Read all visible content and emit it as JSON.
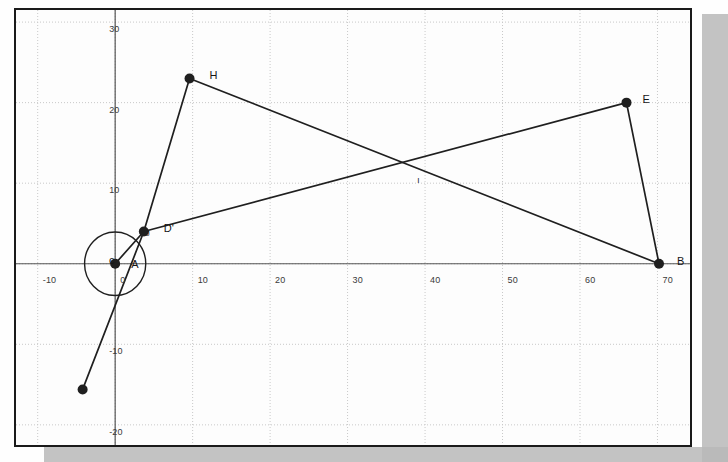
{
  "figure": {
    "title": "",
    "background_color": "#fdfdfd",
    "frame_color": "#1a1a1a",
    "grid_color": "#c9c9c9",
    "axis_color": "#555555",
    "stroke_color": "#1f1f1f"
  },
  "chart_data": {
    "type": "scatter",
    "title": "",
    "xlabel": "",
    "ylabel": "",
    "xlim": [
      -12.8,
      74.2
    ],
    "ylim": [
      -22.5,
      31.5
    ],
    "grid": true,
    "legend": null,
    "xticks": [
      -10,
      0,
      10,
      20,
      30,
      40,
      50,
      60,
      70
    ],
    "xtick_labels": [
      "-10",
      "0",
      "10",
      "20",
      "30",
      "40",
      "50",
      "60",
      "70"
    ],
    "yticks": [
      -20,
      -10,
      0,
      10,
      20,
      30
    ],
    "ytick_labels": [
      "-20",
      "-10",
      "0",
      "10",
      "20",
      "30"
    ],
    "points": [
      {
        "name": "A",
        "label": "A",
        "x": 0.0,
        "y": 0.0,
        "label_dx": 2,
        "label_dy": -14,
        "marker": true,
        "size": 5
      },
      {
        "name": "Dp",
        "label": "D'",
        "x": 3.7,
        "y": 4.0,
        "label_dx": 6,
        "label_dy": -18,
        "marker": true,
        "size": 5
      },
      {
        "name": "J",
        "label": "J",
        "x": 3.7,
        "y": 4.0,
        "label_dx": -12,
        "label_dy": -11,
        "marker": false,
        "size": 0
      },
      {
        "name": "H",
        "label": "H",
        "x": 9.6,
        "y": 23.0,
        "label_dx": 6,
        "label_dy": -17,
        "marker": true,
        "size": 5
      },
      {
        "name": "E",
        "label": "E",
        "x": 66.0,
        "y": 20.0,
        "label_dx": 2,
        "label_dy": -18,
        "marker": true,
        "size": 5
      },
      {
        "name": "B",
        "label": "B",
        "x": 70.2,
        "y": 0.0,
        "label_dx": 4,
        "label_dy": -17,
        "marker": true,
        "size": 5
      },
      {
        "name": "I",
        "label": "I",
        "x": 37.2,
        "y": 12.2,
        "label_dx": 0,
        "label_dy": 3,
        "marker": false,
        "size": 0
      },
      {
        "name": "K",
        "label": "",
        "x": -4.2,
        "y": -15.6,
        "label_dx": 0,
        "label_dy": 0,
        "marker": true,
        "size": 5
      }
    ],
    "segments": [
      {
        "name": "H-Dp",
        "from": "H",
        "to": "Dp"
      },
      {
        "name": "H-B",
        "from": "H",
        "to": "B"
      },
      {
        "name": "Dp-E",
        "from": "Dp",
        "to": "E"
      },
      {
        "name": "E-B",
        "from": "E",
        "to": "B"
      },
      {
        "name": "A-Dp",
        "from": "A",
        "to": "Dp"
      },
      {
        "name": "Dp-K",
        "from": "Dp",
        "to": "K"
      }
    ],
    "circles": [
      {
        "name": "c",
        "label": "c",
        "cx": 0.0,
        "cy": 0.0,
        "r": 3.95,
        "label_x": -2.6,
        "label_y": 2.2
      }
    ]
  }
}
